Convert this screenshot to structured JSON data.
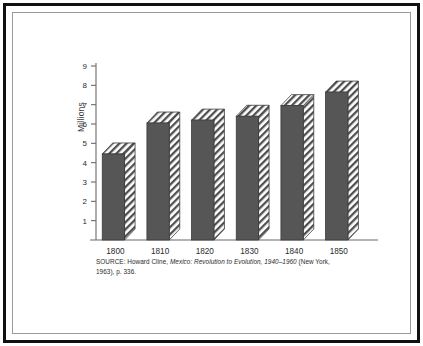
{
  "figure": {
    "frame_style": "double-rule-box",
    "background": "#ffffff"
  },
  "caption": {
    "prefix": "SOURCE: Howard Cline, ",
    "title_italic": "Mexico: Revolution to Evolution, 1940–1960",
    "suffix": " (New York, 1963), p. 336."
  },
  "chart_data": {
    "type": "bar",
    "title": "",
    "subtitle": "",
    "xlabel": "",
    "ylabel": "Millions",
    "categories": [
      "1800",
      "1810",
      "1820",
      "1830",
      "1840",
      "1850"
    ],
    "values": [
      4.45,
      6.05,
      6.2,
      6.4,
      6.95,
      7.65
    ],
    "ylim": [
      0,
      9
    ],
    "yticks": [
      1,
      2,
      3,
      4,
      5,
      6,
      7,
      8,
      9
    ],
    "ytick_labels": [
      "1",
      "2",
      "3",
      "4",
      "5",
      "6",
      "7",
      "8",
      "9"
    ],
    "grid": false,
    "legend": "none",
    "bar_style": "3d-extruded-hatched",
    "bar_face_color": "#565656",
    "bar_hatch_color": "#4a4a4a",
    "axis_color": "#6b6b6b"
  }
}
